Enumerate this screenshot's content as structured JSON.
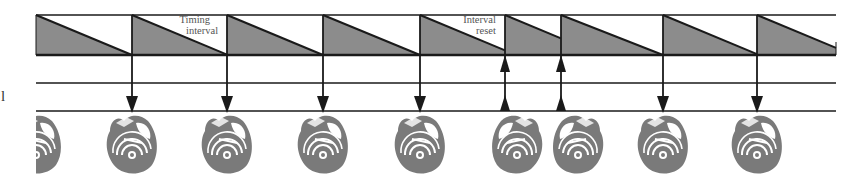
{
  "diagram": {
    "annotations": {
      "timing_interval": [
        "Timing",
        "interval"
      ],
      "interval_reset": [
        "Interval",
        "reset"
      ],
      "left_cut_label": "l"
    },
    "colors": {
      "line": "#1a1a1a",
      "ramp_fill": "#8c8c8c",
      "heart": "#7a7a7a"
    },
    "geometry": {
      "top_line_y": 15,
      "baseline_y": 55,
      "mid_line_y": 83,
      "bottom_line_y": 111,
      "x_start": 36,
      "x_end": 836
    },
    "events": [
      {
        "x": 132,
        "type": "paced",
        "direction": "down"
      },
      {
        "x": 227,
        "type": "paced",
        "direction": "down"
      },
      {
        "x": 323,
        "type": "paced",
        "direction": "down"
      },
      {
        "x": 420,
        "type": "paced",
        "direction": "down"
      },
      {
        "x": 505,
        "type": "sensed",
        "direction": "up"
      },
      {
        "x": 561,
        "type": "sensed",
        "direction": "up"
      },
      {
        "x": 663,
        "type": "paced",
        "direction": "down"
      },
      {
        "x": 757,
        "type": "paced",
        "direction": "down"
      }
    ],
    "hearts": [
      {
        "x": 36,
        "mirrored": false,
        "partial": true
      },
      {
        "x": 132,
        "mirrored": false
      },
      {
        "x": 227,
        "mirrored": false
      },
      {
        "x": 323,
        "mirrored": false
      },
      {
        "x": 420,
        "mirrored": false
      },
      {
        "x": 517,
        "mirrored": true
      },
      {
        "x": 578,
        "mirrored": true
      },
      {
        "x": 663,
        "mirrored": false
      },
      {
        "x": 757,
        "mirrored": false
      }
    ]
  }
}
